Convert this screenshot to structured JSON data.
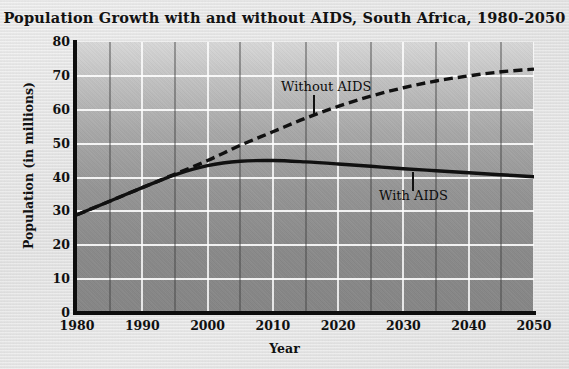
{
  "chart_data": {
    "type": "line",
    "title": "Population Growth with and without AIDS, South Africa, 1980-2050",
    "xlabel": "Year",
    "ylabel": "Population (in millions)",
    "xlim": [
      1980,
      2050
    ],
    "ylim": [
      0,
      80
    ],
    "xticks": [
      "1980",
      "1990",
      "2000",
      "2010",
      "2020",
      "2030",
      "2040",
      "2050"
    ],
    "xtick_values": [
      1980,
      1990,
      2000,
      2010,
      2020,
      2030,
      2040,
      2050
    ],
    "yticks": [
      "0",
      "10",
      "20",
      "30",
      "40",
      "50",
      "60",
      "70",
      "80"
    ],
    "ytick_values": [
      0,
      10,
      20,
      30,
      40,
      50,
      60,
      70,
      80
    ],
    "grid": true,
    "legend_position": "inline-annotation",
    "x": [
      1980,
      1985,
      1990,
      1995,
      2000,
      2005,
      2010,
      2015,
      2020,
      2025,
      2030,
      2035,
      2040,
      2045,
      2050
    ],
    "series": [
      {
        "name": "Without AIDS",
        "style": "dashed",
        "color": "#111111",
        "values": [
          29.0,
          33.0,
          37.0,
          41.0,
          45.0,
          49.5,
          53.5,
          57.5,
          61.0,
          64.0,
          66.5,
          68.5,
          70.0,
          71.2,
          72.0
        ]
      },
      {
        "name": "With AIDS",
        "style": "solid",
        "color": "#111111",
        "values": [
          29.0,
          33.0,
          37.0,
          40.8,
          43.5,
          44.8,
          45.0,
          44.6,
          44.0,
          43.3,
          42.6,
          42.0,
          41.4,
          40.8,
          40.2
        ]
      }
    ],
    "annotations": [
      {
        "text": "Without AIDS",
        "anchor_year": 2016,
        "anchor_value": 58
      },
      {
        "text": "With AIDS",
        "anchor_year": 2031,
        "anchor_value": 44
      }
    ]
  }
}
